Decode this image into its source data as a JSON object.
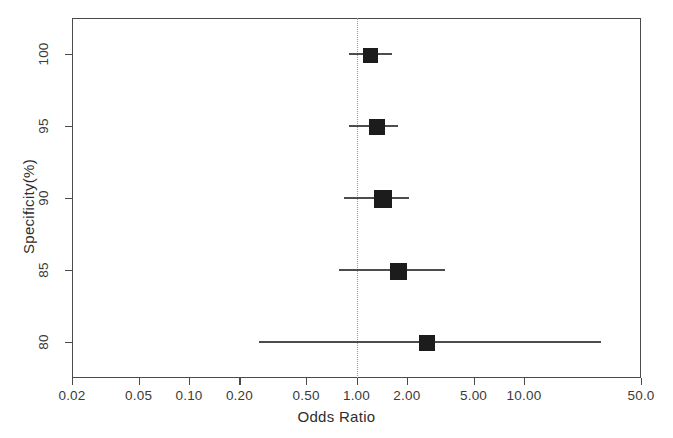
{
  "chart_data": {
    "type": "scatter",
    "title": "",
    "xlabel": "Odds Ratio",
    "ylabel": "Specificity(%)",
    "xscale": "log",
    "xlim": [
      0.02,
      50.0
    ],
    "xticks": [
      0.02,
      0.05,
      0.1,
      0.2,
      0.5,
      1.0,
      2.0,
      5.0,
      10.0,
      50.0
    ],
    "xtick_labels": [
      "0.02",
      "0.05",
      "0.10",
      "0.20",
      "0.50",
      "1.00",
      "2.00",
      "5.00",
      "10.00",
      "50.0"
    ],
    "ylim": [
      77.5,
      102.5
    ],
    "yticks": [
      100,
      95,
      90,
      85,
      80
    ],
    "ytick_labels": [
      "100",
      "95",
      "90",
      "85",
      "80"
    ],
    "grid": false,
    "legend": "none",
    "reference_line": 1.0,
    "reference_line_style": "dotted",
    "marker_style": "filled-square",
    "marker_color": "#1c1c1c",
    "line_color": "#4d4d4d",
    "frame_color": "#4a4a4a",
    "points": [
      {
        "category": "100",
        "y": 100,
        "or": 1.2,
        "ci_low": 0.9,
        "ci_high": 1.63,
        "marker_size": 13
      },
      {
        "category": "95",
        "y": 95,
        "or": 1.3,
        "ci_low": 0.9,
        "ci_high": 1.78,
        "marker_size": 14
      },
      {
        "category": "90",
        "y": 90,
        "or": 1.42,
        "ci_low": 0.84,
        "ci_high": 2.05,
        "marker_size": 16
      },
      {
        "category": "85",
        "y": 85,
        "or": 1.76,
        "ci_low": 0.79,
        "ci_high": 3.4,
        "marker_size": 15
      },
      {
        "category": "80",
        "y": 80,
        "or": 2.6,
        "ci_low": 0.26,
        "ci_high": 29.0,
        "marker_size": 14
      }
    ]
  },
  "axes": {
    "x_title": "Odds Ratio",
    "y_title": "Specificity(%)"
  }
}
